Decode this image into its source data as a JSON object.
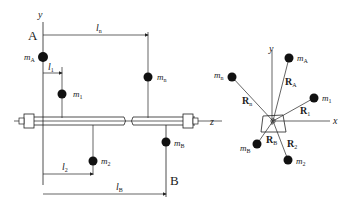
{
  "left_view": {
    "axis_y": "y",
    "axis_z": "z",
    "plane_A": "A",
    "plane_B": "B",
    "masses": {
      "mA": {
        "sym": "m",
        "sub": "A"
      },
      "m1": {
        "sym": "m",
        "sub": "1"
      },
      "m2": {
        "sym": "m",
        "sub": "2"
      },
      "mn": {
        "sym": "m",
        "sub": "n"
      },
      "mB": {
        "sym": "m",
        "sub": "B"
      }
    },
    "dimensions": {
      "l1": {
        "sym": "l",
        "sub": "1"
      },
      "l2": {
        "sym": "l",
        "sub": "2"
      },
      "ln": {
        "sym": "l",
        "sub": "n"
      },
      "lB": {
        "sym": "l",
        "sub": "B"
      }
    }
  },
  "right_view": {
    "axis_x": "x",
    "axis_y": "y",
    "masses": {
      "mA": {
        "sym": "m",
        "sub": "A"
      },
      "m1": {
        "sym": "m",
        "sub": "1"
      },
      "m2": {
        "sym": "m",
        "sub": "2"
      },
      "mn": {
        "sym": "m",
        "sub": "n"
      },
      "mB": {
        "sym": "m",
        "sub": "B"
      }
    },
    "radii": {
      "RA": {
        "sym": "R",
        "sub": "A"
      },
      "R1": {
        "sym": "R",
        "sub": "1"
      },
      "R2": {
        "sym": "R",
        "sub": "2"
      },
      "Rn": {
        "sym": "R",
        "sub": "n"
      },
      "RB": {
        "sym": "R",
        "sub": "B"
      }
    }
  },
  "colors": {
    "ink": "#222222",
    "mass": "#111111",
    "background": "#ffffff"
  }
}
